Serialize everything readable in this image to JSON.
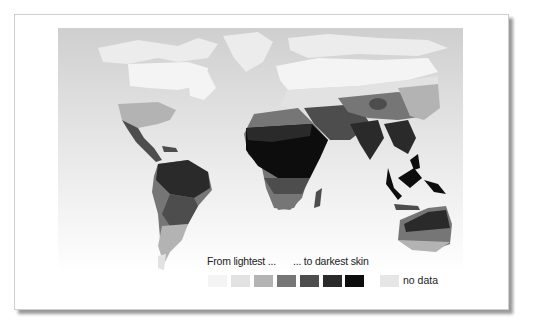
{
  "map": {
    "title": "World distribution of human skin color",
    "ocean_color": "#dcdcdc",
    "regions": [
      {
        "name": "arctic-no-data",
        "shade": "no_data"
      },
      {
        "name": "north-america-north",
        "shade": 1
      },
      {
        "name": "usa",
        "shade": 3
      },
      {
        "name": "mexico-central-america",
        "shade": 5
      },
      {
        "name": "amazon",
        "shade": 6
      },
      {
        "name": "south-america-central",
        "shade": 4
      },
      {
        "name": "south-america-south",
        "shade": 3
      },
      {
        "name": "europe-north",
        "shade": 1
      },
      {
        "name": "europe-south",
        "shade": 3
      },
      {
        "name": "sahara",
        "shade": 5
      },
      {
        "name": "sub-saharan-africa",
        "shade": 7
      },
      {
        "name": "southern-africa",
        "shade": 4
      },
      {
        "name": "middle-east",
        "shade": 5
      },
      {
        "name": "india",
        "shade": 6
      },
      {
        "name": "central-asia",
        "shade": 4
      },
      {
        "name": "east-asia",
        "shade": 3
      },
      {
        "name": "southeast-asia",
        "shade": 6
      },
      {
        "name": "northern-australia",
        "shade": 6
      },
      {
        "name": "southern-australia",
        "shade": 3
      }
    ]
  },
  "legend": {
    "from_label": "From lightest ...",
    "to_label": "... to darkest skin",
    "scale_colors": [
      "#f4f4f4",
      "#e2e2e2",
      "#b3b3b3",
      "#767676",
      "#4d4d4d",
      "#2a2a2a",
      "#0d0d0d"
    ],
    "no_data_label": "no data",
    "no_data_color": "#e6e6e6"
  }
}
